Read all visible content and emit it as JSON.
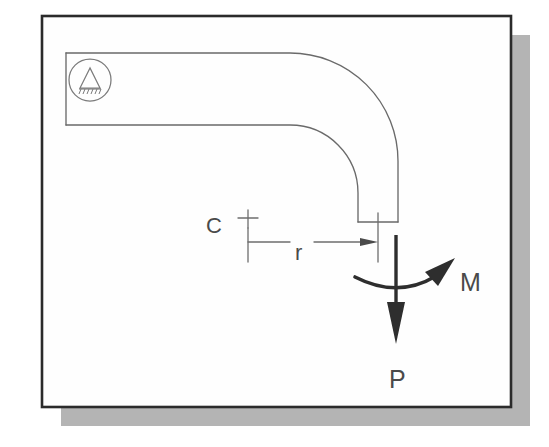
{
  "figure": {
    "background_color": "#ffffff",
    "frame": {
      "border_color": "#2b2b2b",
      "fill_color": "#fefefe",
      "shadow_color": "#b4b4b4",
      "x": 42,
      "y": 16,
      "width": 469,
      "height": 391,
      "shadow_offset": 19
    },
    "member": {
      "name": "curved-beam",
      "stroke_color": "#6a6a6a",
      "stroke_width": 1.3,
      "fill_color": "none",
      "description": "ninety degree elbow formed by straight horizontal run and quarter circle bend ending in vertical free end"
    },
    "support": {
      "name": "pinned-support-symbol",
      "center_x": 90,
      "center_y": 80,
      "radius": 21,
      "stroke_color": "#7a7a7a",
      "glyph": "triangle-with-ground-hatching"
    },
    "dimension": {
      "name": "radius-dimension",
      "label": "r",
      "stroke_color": "#6d6d6d",
      "from_x": 248,
      "to_x": 378,
      "line_y": 242,
      "arrow_direction": "right"
    },
    "center_mark": {
      "name": "center-point-mark",
      "label": "C",
      "x": 248,
      "y": 218
    },
    "loads": {
      "force": {
        "name": "applied-force-P",
        "label": "P",
        "direction": "down",
        "color": "#2e2e2e",
        "shaft_x": 396,
        "shaft_top_y": 235,
        "shaft_bottom_y": 340,
        "label_x": 398,
        "label_y": 384
      },
      "moment": {
        "name": "applied-moment-M",
        "label": "M",
        "direction": "counterclockwise-curved-arrow",
        "color": "#2e2e2e",
        "label_x": 472,
        "label_y": 285
      }
    },
    "labels": [
      {
        "id": "center-label",
        "text": "C",
        "x": 206,
        "y": 233,
        "size": 22
      },
      {
        "id": "radius-label",
        "text": "r",
        "x": 299,
        "y": 258,
        "size": 22
      },
      {
        "id": "moment-label",
        "text": "M",
        "x": 460,
        "y": 291,
        "size": 24
      },
      {
        "id": "force-label",
        "text": "P",
        "x": 390,
        "y": 388,
        "size": 24
      }
    ]
  }
}
